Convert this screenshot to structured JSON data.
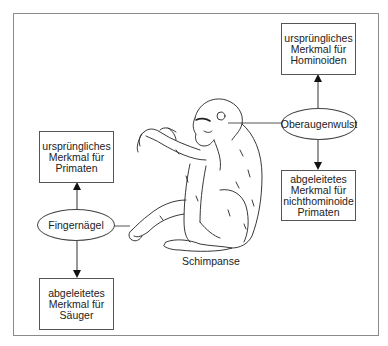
{
  "diagram": {
    "subject_label": "Schimpanse",
    "traits": [
      {
        "name": "Oberaugenwulst",
        "upper_box": [
          "ursprüngliches",
          "Merkmal für",
          "Hominoiden"
        ],
        "lower_box": [
          "abgeleitetes",
          "Merkmal für",
          "nichthominoide",
          "Primaten"
        ]
      },
      {
        "name": "Fingernägel",
        "upper_box": [
          "ursprüngliches",
          "Merkmal für",
          "Primaten"
        ],
        "lower_box": [
          "abgeleitetes",
          "Merkmal für",
          "Säuger"
        ]
      }
    ]
  }
}
